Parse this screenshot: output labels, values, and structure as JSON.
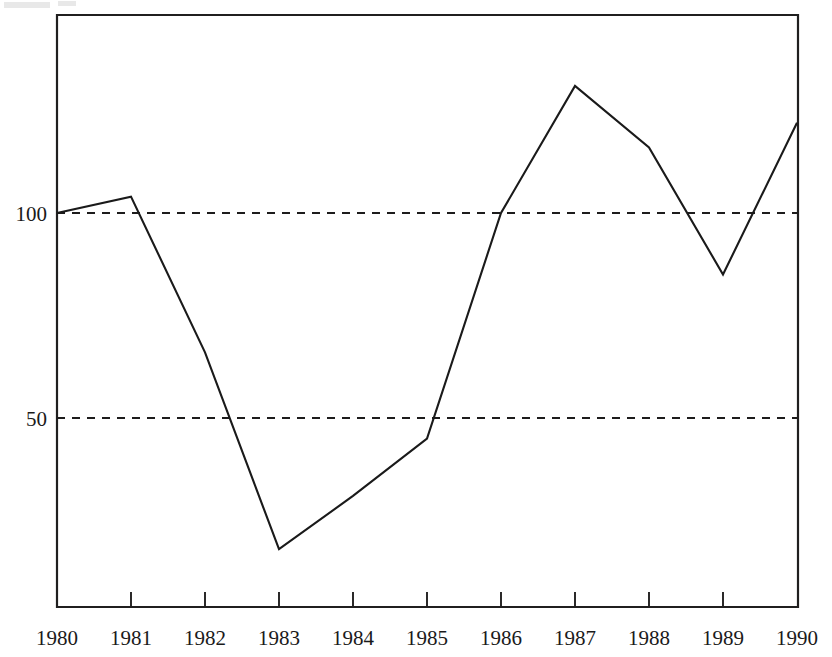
{
  "chart_data": {
    "type": "line",
    "title": "",
    "subtitle": "",
    "xlabel": "",
    "ylabel": "",
    "categories": [
      "1980",
      "1981",
      "1982",
      "1983",
      "1984",
      "1985",
      "1986",
      "1987",
      "1988",
      "1989",
      "1990"
    ],
    "x": [
      1980,
      1981,
      1982,
      1983,
      1984,
      1985,
      1986,
      1987,
      1988,
      1989,
      1990
    ],
    "values": [
      100,
      104,
      66,
      18,
      31,
      45,
      100,
      131,
      116,
      85,
      122
    ],
    "series": [
      {
        "name": "index",
        "values": [
          100,
          104,
          66,
          18,
          31,
          45,
          100,
          131,
          116,
          85,
          122
        ]
      }
    ],
    "y_ticks": [
      50,
      100
    ],
    "y_tick_labels": [
      "50",
      "100"
    ],
    "x_tick_labels": [
      "1980",
      "1981",
      "1982",
      "1983",
      "1984",
      "1985",
      "1986",
      "1987",
      "1988",
      "1989",
      "1990"
    ],
    "xlim": [
      1980,
      1990
    ],
    "ylim": [
      0,
      148
    ],
    "grid": "horizontal-dashed-at-50-and-100",
    "legend": "none",
    "legend_position": "none",
    "annotations": [],
    "line_color": "#1a1a1a",
    "grid_color": "#1d1c1c",
    "axis_color": "#201f1f",
    "background_color": "#ffffff"
  },
  "axis": {
    "y_labels": [
      "100",
      "50"
    ],
    "x_labels": [
      "1980",
      "1981",
      "1982",
      "1983",
      "1984",
      "1985",
      "1986",
      "1987",
      "1988",
      "1989",
      "1990"
    ]
  }
}
